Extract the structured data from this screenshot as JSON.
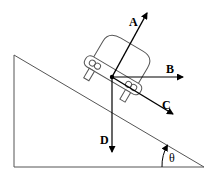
{
  "diagram": {
    "title": "",
    "labels": {
      "A": "A",
      "B": "B",
      "C": "C",
      "D": "D",
      "angle": "θ"
    },
    "colors": {
      "line": "#000000",
      "incline": "#555555",
      "background": "#ffffff"
    }
  }
}
